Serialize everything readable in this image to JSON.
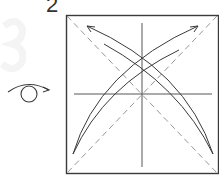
{
  "step": {
    "number": "2"
  },
  "symbols": {
    "flip_over": "turn-over-icon"
  },
  "diagram": {
    "shape": "square",
    "creases": {
      "center_horizontal": "solid",
      "center_vertical": "solid",
      "diagonals": "dashed-valley"
    },
    "arrows": [
      {
        "from": "bottom-left corner",
        "to": "top-right",
        "style": "curved"
      },
      {
        "from": "bottom-right corner",
        "to": "top-left",
        "style": "curved"
      }
    ]
  },
  "colors": {
    "line": "#3a3a3a",
    "dashed": "#8a8a8a",
    "paper": "#ffffff"
  }
}
